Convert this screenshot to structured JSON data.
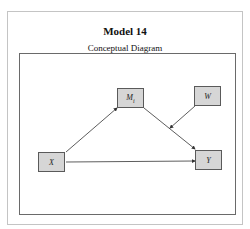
{
  "header": {
    "title": "Model 14",
    "subtitle": "Conceptual Diagram"
  },
  "diagram": {
    "nodes": [
      {
        "id": "X",
        "label": "X"
      },
      {
        "id": "M",
        "label": "Mi"
      },
      {
        "id": "W",
        "label": "W"
      },
      {
        "id": "Y",
        "label": "Y"
      }
    ],
    "edges": [
      {
        "from": "X",
        "to": "M"
      },
      {
        "from": "M",
        "to": "Y"
      },
      {
        "from": "X",
        "to": "Y"
      },
      {
        "from": "W",
        "to": "M-Y path"
      }
    ],
    "colors": {
      "node_fill": "#d6d6d6",
      "node_border": "#5a5a5a",
      "line": "#333333"
    }
  }
}
